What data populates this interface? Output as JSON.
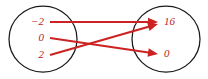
{
  "diagram": {
    "type": "mapping-diagram",
    "title": "",
    "background_color": "#ffffff",
    "outline_color": "#1a1a1a",
    "accent_color": "#cc2222",
    "label_color": "#bb2222",
    "domain": {
      "name": "domain-set",
      "elements": [
        {
          "label": "−2",
          "x": 44,
          "y": 22
        },
        {
          "label": "0",
          "x": 44,
          "y": 38
        },
        {
          "label": "2",
          "x": 44,
          "y": 55
        }
      ],
      "ellipse": {
        "cx": 43,
        "cy": 39,
        "rx": 34,
        "ry": 33
      }
    },
    "codomain": {
      "name": "codomain-set",
      "elements": [
        {
          "label": "16",
          "x": 164,
          "y": 22
        },
        {
          "label": "0",
          "x": 164,
          "y": 54
        }
      ],
      "ellipse": {
        "cx": 166,
        "cy": 39,
        "rx": 34,
        "ry": 33
      }
    },
    "arrows": [
      {
        "name": "arrow-neg2-to-16",
        "from": "−2",
        "to": "16",
        "x1": 50,
        "y1": 22,
        "x2": 158,
        "y2": 22
      },
      {
        "name": "arrow-0-to-0",
        "from": "0",
        "to": "0",
        "x1": 50,
        "y1": 38,
        "x2": 158,
        "y2": 54
      },
      {
        "name": "arrow-2-to-16",
        "from": "2",
        "to": "16",
        "x1": 50,
        "y1": 55,
        "x2": 158,
        "y2": 24
      }
    ],
    "mappings": [
      {
        "input": "−2",
        "output": "16"
      },
      {
        "input": "0",
        "output": "0"
      },
      {
        "input": "2",
        "output": "16"
      }
    ]
  }
}
